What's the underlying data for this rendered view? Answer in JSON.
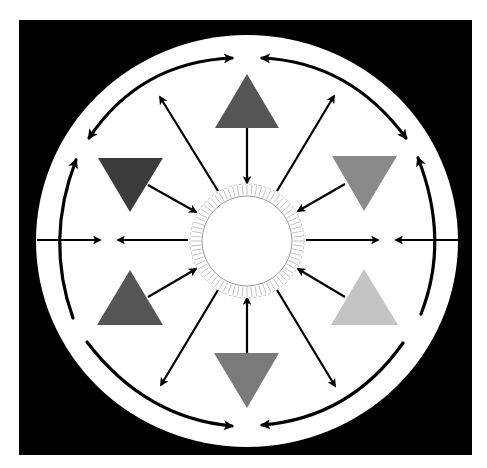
{
  "diagram": {
    "title": "",
    "canvas": {
      "width": 487,
      "height": 468,
      "background": "#ffffff"
    },
    "frame": {
      "x": 19,
      "y": 20,
      "width": 453,
      "height": 435,
      "fill": "#000000"
    },
    "outer_circle": {
      "cx": 247,
      "cy": 241,
      "rx": 211,
      "ry": 206,
      "fill": "#ffffff"
    },
    "core": {
      "cx": 247,
      "cy": 241,
      "inner_r": 45,
      "outer_r": 57,
      "fill": "#ffffff",
      "ring_stroke": "#9a9a9a",
      "hatch_color": "#b5b5b5",
      "hatch_count": 72
    },
    "triangles": [
      {
        "name": "triangle-top",
        "direction": "up",
        "points": "247,74 279,128 215,128",
        "fill": "#555555"
      },
      {
        "name": "triangle-upper-left",
        "direction": "down",
        "points": "98,158 163,158 130,212",
        "fill": "#3c3c3c"
      },
      {
        "name": "triangle-upper-right",
        "direction": "down",
        "points": "332,156 397,156 364,211",
        "fill": "#8a8a8a"
      },
      {
        "name": "triangle-lower-left",
        "direction": "up",
        "points": "130,270 163,325 97,325",
        "fill": "#555555"
      },
      {
        "name": "triangle-lower-right",
        "direction": "up",
        "points": "364,269 398,325 331,325",
        "fill": "#c4c4c4"
      },
      {
        "name": "triangle-bottom",
        "direction": "down",
        "points": "214,353 279,353 247,408",
        "fill": "#7a7a7a"
      }
    ],
    "radial_arrows": [
      {
        "name": "arrow-top-triangle-to-core",
        "x1": 247,
        "y1": 128,
        "x2": 247,
        "y2": 183,
        "start_head": false,
        "end_head": true
      },
      {
        "name": "arrow-core-to-upper-left",
        "x1": 218,
        "y1": 191,
        "x2": 160,
        "y2": 97,
        "start_head": false,
        "end_head": true
      },
      {
        "name": "arrow-core-to-upper-right",
        "x1": 277,
        "y1": 191,
        "x2": 334,
        "y2": 96,
        "start_head": false,
        "end_head": true
      },
      {
        "name": "arrow-upper-left-triangle-to-core",
        "x1": 148,
        "y1": 185,
        "x2": 196,
        "y2": 212,
        "start_head": false,
        "end_head": true
      },
      {
        "name": "arrow-upper-right-triangle-to-core",
        "x1": 345,
        "y1": 184,
        "x2": 298,
        "y2": 211,
        "start_head": false,
        "end_head": true
      },
      {
        "name": "arrow-core-to-left",
        "x1": 188,
        "y1": 240,
        "x2": 118,
        "y2": 240,
        "start_head": false,
        "end_head": true
      },
      {
        "name": "arrow-core-to-right",
        "x1": 306,
        "y1": 240,
        "x2": 378,
        "y2": 240,
        "start_head": false,
        "end_head": true
      },
      {
        "name": "arrow-edge-left-inward",
        "x1": 37,
        "y1": 240,
        "x2": 100,
        "y2": 240,
        "start_head": false,
        "end_head": true
      },
      {
        "name": "arrow-edge-right-inward",
        "x1": 458,
        "y1": 240,
        "x2": 396,
        "y2": 240,
        "start_head": false,
        "end_head": true
      },
      {
        "name": "arrow-lower-left-triangle-to-core",
        "x1": 148,
        "y1": 297,
        "x2": 196,
        "y2": 269,
        "start_head": false,
        "end_head": true
      },
      {
        "name": "arrow-lower-right-triangle-to-core",
        "x1": 345,
        "y1": 297,
        "x2": 298,
        "y2": 269,
        "start_head": false,
        "end_head": true
      },
      {
        "name": "arrow-core-to-lower-left",
        "x1": 218,
        "y1": 290,
        "x2": 161,
        "y2": 385,
        "start_head": false,
        "end_head": true
      },
      {
        "name": "arrow-core-to-lower-right",
        "x1": 277,
        "y1": 290,
        "x2": 335,
        "y2": 386,
        "start_head": false,
        "end_head": true
      },
      {
        "name": "arrow-bottom-triangle-to-core",
        "x1": 247,
        "y1": 353,
        "x2": 247,
        "y2": 298,
        "start_head": false,
        "end_head": true
      }
    ],
    "orbit_arrows": [
      {
        "name": "orbit-arc-top-left",
        "d": "M 232 58 Q 140 62 89 138",
        "start_head": true,
        "end_head": true
      },
      {
        "name": "orbit-arc-top-right",
        "d": "M 262 58 Q 350 62 406 138",
        "start_head": true,
        "end_head": true
      },
      {
        "name": "orbit-arc-left",
        "d": "M 76 160 Q 45 240 73 318",
        "start_head": true,
        "end_head": false
      },
      {
        "name": "orbit-arc-right",
        "d": "M 418 158 Q 450 240 421 314",
        "start_head": true,
        "end_head": false
      },
      {
        "name": "orbit-arc-bottom-left",
        "d": "M 87 342 Q 145 418 232 426",
        "start_head": false,
        "end_head": true
      },
      {
        "name": "orbit-arc-bottom-right",
        "d": "M 403 343 Q 350 418 262 425",
        "start_head": false,
        "end_head": true
      }
    ],
    "arrow_style": {
      "radial_stroke": "#000000",
      "radial_width": 2.2,
      "orbit_stroke": "#000000",
      "orbit_width": 3.2
    }
  }
}
